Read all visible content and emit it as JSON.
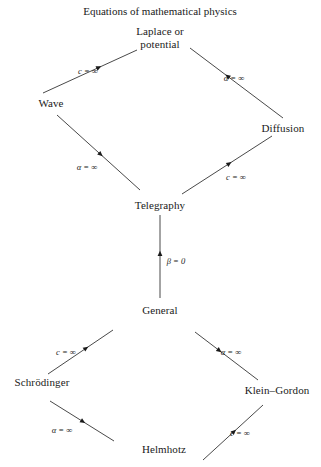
{
  "title": "Equations of mathematical physics",
  "background_color": "#ffffff",
  "ink_color": "#1a1a1a",
  "nodes": {
    "laplace": {
      "label": "Laplace or\npotential",
      "line1": "Laplace or",
      "line2": "potential",
      "x": 160,
      "y": 37
    },
    "wave": {
      "label": "Wave",
      "x": 51,
      "y": 103
    },
    "diffusion": {
      "label": "Diffusion",
      "x": 283,
      "y": 128
    },
    "telegraphy": {
      "label": "Telegraphy",
      "x": 160,
      "y": 205
    },
    "general": {
      "label": "General",
      "x": 160,
      "y": 310
    },
    "schrodinger": {
      "label": "Schrödinger",
      "x": 42,
      "y": 382
    },
    "kleingordon": {
      "label": "Klein–Gordon",
      "x": 277,
      "y": 390
    },
    "helmhotz": {
      "label": "Helmhotz",
      "x": 164,
      "y": 449
    }
  },
  "edges": [
    {
      "id": "wave-to-laplace",
      "from": "wave",
      "to": "laplace",
      "label": "c = ∞",
      "label_x": 88,
      "label_y": 71
    },
    {
      "id": "diffusion-to-laplace",
      "from": "diffusion",
      "to": "laplace",
      "label": "α = ∞",
      "label_x": 234,
      "label_y": 78
    },
    {
      "id": "wave-to-telegraphy",
      "from": "wave",
      "to": "telegraphy",
      "label": "α = ∞",
      "label_x": 87,
      "label_y": 167
    },
    {
      "id": "telegraphy-to-diffusion",
      "from": "telegraphy",
      "to": "diffusion",
      "label": "c = ∞",
      "label_x": 236,
      "label_y": 177
    },
    {
      "id": "general-to-telegraphy",
      "from": "general",
      "to": "telegraphy",
      "label": "β = 0",
      "label_x": 176,
      "label_y": 261
    },
    {
      "id": "schrodinger-to-general",
      "from": "schrodinger",
      "to": "general",
      "label": "c = ∞",
      "label_x": 66,
      "label_y": 352
    },
    {
      "id": "general-to-kleingordon",
      "from": "general",
      "to": "kleingordon",
      "label": "α = ∞",
      "label_x": 231,
      "label_y": 352
    },
    {
      "id": "schrodinger-to-helmhotz",
      "from": "schrodinger",
      "to": "helmhotz",
      "label": "α = ∞",
      "label_x": 62,
      "label_y": 430
    },
    {
      "id": "helmhotz-to-kleingordon",
      "from": "helmhotz",
      "to": "kleingordon",
      "label": "c = ∞",
      "label_x": 240,
      "label_y": 433
    }
  ],
  "lines": [
    {
      "id": "wave-to-laplace",
      "x1": 43,
      "y1": 93,
      "x2": 137,
      "y2": 50,
      "arrow_t": 0.62
    },
    {
      "id": "diffusion-to-laplace",
      "x1": 283,
      "y1": 118,
      "x2": 190,
      "y2": 48,
      "arrow_t": 0.62
    },
    {
      "id": "wave-to-telegraphy",
      "x1": 57,
      "y1": 115,
      "x2": 140,
      "y2": 190,
      "arrow_t": 0.55
    },
    {
      "id": "telegraphy-to-diffusion",
      "x1": 182,
      "y1": 194,
      "x2": 272,
      "y2": 136,
      "arrow_t": 0.55
    },
    {
      "id": "general-to-telegraphy",
      "x1": 160,
      "y1": 298,
      "x2": 160,
      "y2": 215,
      "arrow_t": 0.57
    },
    {
      "id": "schrodinger-to-general",
      "x1": 48,
      "y1": 374,
      "x2": 113,
      "y2": 330,
      "arrow_t": 0.62
    },
    {
      "id": "general-to-kleingordon",
      "x1": 195,
      "y1": 332,
      "x2": 258,
      "y2": 380,
      "arrow_t": 0.42
    },
    {
      "id": "schrodinger-to-helmhotz",
      "x1": 50,
      "y1": 401,
      "x2": 114,
      "y2": 441,
      "arrow_t": 0.55
    },
    {
      "id": "helmhotz-to-kleingordon",
      "x1": 203,
      "y1": 460,
      "x2": 263,
      "y2": 405,
      "arrow_t": 0.55
    }
  ]
}
